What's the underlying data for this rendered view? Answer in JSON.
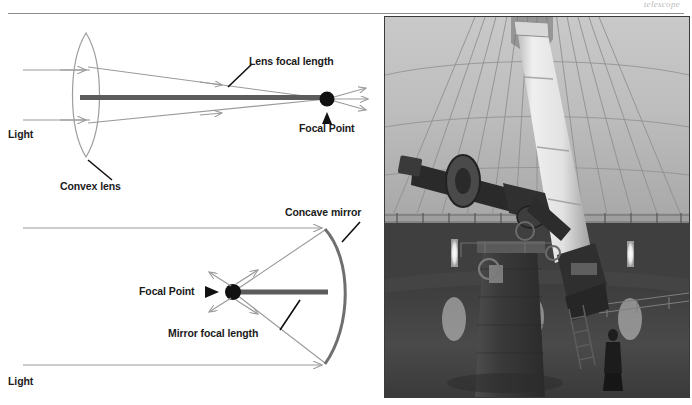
{
  "page": {
    "header_fragment": "telescope",
    "figure_domain": "optics-diagram-and-observatory-photo"
  },
  "diagrams": {
    "lens": {
      "labels": {
        "light": "Light",
        "convex_lens": "Convex lens",
        "focal_length": "Lens focal length",
        "focal_point": "Focal Point"
      }
    },
    "mirror": {
      "labels": {
        "light": "Light",
        "concave_mirror": "Concave mirror",
        "focal_length": "Mirror focal length",
        "focal_point": "Focal Point"
      }
    }
  },
  "photo": {
    "caption": "",
    "subject": "refracting telescope inside observatory dome",
    "elements": {
      "dome": "ribbed hemispherical dome interior",
      "telescope_tube": "long white refractor tube",
      "mount": "dark equatorial mount with setting circles",
      "pier": "tall dark masonry pier",
      "observer": "person standing at telescope base",
      "wall_lamps": "three vertical wall lights"
    }
  },
  "colors": {
    "ray": "#9a9a9a",
    "focal_bar": "#5c5c5c",
    "mirror_arc": "#6f6f6f",
    "lens_outline": "#9d9d9d",
    "leader": "#111111",
    "text": "#1b1b1b",
    "rule": "#8d8d8d"
  }
}
